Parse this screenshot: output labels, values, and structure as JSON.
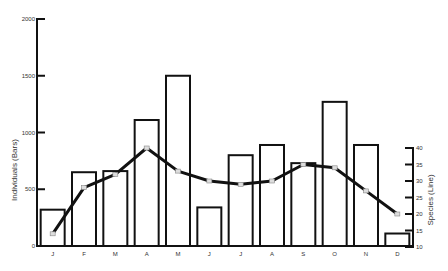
{
  "chart_data": {
    "type": "bar+line",
    "title": "",
    "categories": [
      "J",
      "F",
      "M",
      "A",
      "M",
      "J",
      "J",
      "A",
      "S",
      "O",
      "N",
      "D"
    ],
    "series": [
      {
        "name": "Individuals (Bars)",
        "type": "bar",
        "axis": "left",
        "values": [
          320,
          650,
          660,
          1110,
          1500,
          340,
          800,
          890,
          730,
          1270,
          890,
          110
        ]
      },
      {
        "name": "Species (Line)",
        "type": "line",
        "axis": "right",
        "values": [
          14,
          28,
          32,
          40,
          33,
          30,
          29,
          30,
          35,
          34,
          27,
          20
        ]
      }
    ],
    "ylabel": "Individuals (Bars)",
    "y2label": "Species (Line)",
    "ylim": [
      0,
      2000
    ],
    "y2lim": [
      10,
      40
    ],
    "yticks": [
      "0",
      "500",
      "1000",
      "1500",
      "2000"
    ],
    "y2ticks": [
      "10",
      "15",
      "20",
      "25",
      "30",
      "35",
      "40"
    ],
    "grid": false,
    "legend": "none"
  }
}
